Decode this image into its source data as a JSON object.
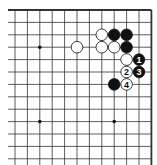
{
  "diagram": {
    "type": "go-board-corner",
    "visible_columns": 12,
    "visible_rows": 13,
    "edges": [
      "top",
      "right"
    ],
    "colors": {
      "line": "#333333",
      "black_stone": "#111111",
      "white_stone": "#ffffff",
      "background": "#ffffff"
    },
    "star_points": [
      {
        "col": 2,
        "row": 3
      },
      {
        "col": 2,
        "row": 9
      },
      {
        "col": 8,
        "row": 9
      }
    ],
    "stones": [
      {
        "col": 7,
        "row": 2,
        "color": "white",
        "label": ""
      },
      {
        "col": 8,
        "row": 2,
        "color": "black",
        "label": ""
      },
      {
        "col": 9,
        "row": 2,
        "color": "black",
        "label": ""
      },
      {
        "col": 5,
        "row": 3,
        "color": "white",
        "label": ""
      },
      {
        "col": 7,
        "row": 3,
        "color": "white",
        "label": ""
      },
      {
        "col": 8,
        "row": 3,
        "color": "white",
        "label": ""
      },
      {
        "col": 9,
        "row": 3,
        "color": "black",
        "label": ""
      },
      {
        "col": 9,
        "row": 4,
        "color": "white",
        "label": ""
      },
      {
        "col": 10,
        "row": 4,
        "color": "black",
        "label": "1"
      },
      {
        "col": 9,
        "row": 5,
        "color": "white",
        "label": "2"
      },
      {
        "col": 10,
        "row": 5,
        "color": "black",
        "label": "3"
      },
      {
        "col": 8,
        "row": 6,
        "color": "black",
        "label": ""
      },
      {
        "col": 9,
        "row": 6,
        "color": "white",
        "label": "4"
      }
    ]
  }
}
